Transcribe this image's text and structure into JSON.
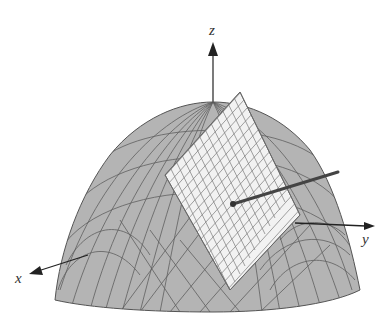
{
  "figure": {
    "axes": {
      "x": {
        "label": "x"
      },
      "y": {
        "label": "y"
      },
      "z": {
        "label": "z"
      }
    },
    "colors": {
      "surface_fill": "#b4b4b4",
      "surface_grid": "#555555",
      "plane_fill": "#f2f2f2",
      "plane_grid": "#7a7a7a",
      "normal_vector": "#444444",
      "axis": "#222222",
      "background": "#ffffff"
    },
    "elements": [
      {
        "name": "paraboloid-surface"
      },
      {
        "name": "tangent-plane"
      },
      {
        "name": "normal-vector"
      },
      {
        "name": "x-axis"
      },
      {
        "name": "y-axis"
      },
      {
        "name": "z-axis"
      }
    ]
  }
}
